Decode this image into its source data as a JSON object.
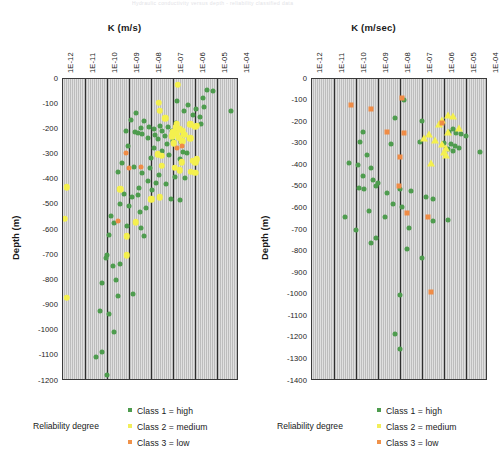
{
  "scan_header": "Hydraulic conductivity versus depth - reliability classified data",
  "legend": {
    "title": "Reliability degree",
    "items": [
      {
        "label": "Class 1 = high",
        "color": "#4e9c4e",
        "shape": "square"
      },
      {
        "label": "Class 2 = medium",
        "color": "#f2ee5a",
        "shape": "square"
      },
      {
        "label": "Class 3 = low",
        "color": "#f0924a",
        "shape": "square"
      }
    ]
  },
  "colors": {
    "class1": "#4e9c4e",
    "class2": "#f4f04e",
    "class3": "#f08c46",
    "plot_background": "#c9c9c9",
    "axis": "#2e2e2e"
  },
  "chart_data": [
    {
      "id": "left",
      "type": "scatter",
      "title": "",
      "xlabel": "K (m/s)",
      "ylabel": "Depth (m)",
      "xscale": "log",
      "xlim": [
        1e-12,
        0.0001
      ],
      "xticks": [
        1e-12,
        1e-11,
        1e-10,
        1e-09,
        1e-08,
        1e-07,
        1e-06,
        1e-05,
        0.0001
      ],
      "xticklabels": [
        "1E-12",
        "1E-11",
        "1E-10",
        "1E-09",
        "1E-08",
        "1E-07",
        "1E-06",
        "1E-05",
        "1E-04"
      ],
      "ylim": [
        -1200,
        0
      ],
      "yticks": [
        0,
        -100,
        -200,
        -300,
        -400,
        -500,
        -600,
        -700,
        -800,
        -900,
        -1000,
        -1100,
        -1200
      ],
      "yticklabels": [
        "0",
        "-100",
        "-200",
        "-300",
        "-400",
        "-500",
        "-600",
        "-700",
        "-800",
        "-900",
        "-1000",
        "-1100",
        "-1200"
      ],
      "grid": "vertical",
      "legend_position": "below",
      "series": [
        {
          "name": "Class 1 = high",
          "marker": "circle",
          "color": "#4e9c4e",
          "points": [
            [
              3.5e-06,
              -45
            ],
            [
              6.5e-06,
              -48
            ],
            [
              2.2e-06,
              -75
            ],
            [
              1.5e-07,
              -88
            ],
            [
              5e-07,
              -105
            ],
            [
              2.5e-06,
              -110
            ],
            [
              1.1e-06,
              -118
            ],
            [
              4.5e-05,
              -125
            ],
            [
              3e-07,
              -128
            ],
            [
              2e-09,
              -133
            ],
            [
              8e-07,
              -142
            ],
            [
              1.6e-06,
              -150
            ],
            [
              1.2e-09,
              -163
            ],
            [
              5e-09,
              -168
            ],
            [
              1.3e-07,
              -175
            ],
            [
              1.9e-06,
              -178
            ],
            [
              3.5e-09,
              -195
            ],
            [
              7e-10,
              -206
            ],
            [
              1.8e-09,
              -212
            ],
            [
              2.6e-09,
              -215
            ],
            [
              4e-09,
              -218
            ],
            [
              2.5e-08,
              -186
            ],
            [
              8e-09,
              -190
            ],
            [
              6e-08,
              -192
            ],
            [
              1.3e-08,
              -200
            ],
            [
              3e-08,
              -205
            ],
            [
              9e-08,
              -208
            ],
            [
              1.5e-08,
              -222
            ],
            [
              4.5e-08,
              -228
            ],
            [
              7.5e-09,
              -236
            ],
            [
              2e-08,
              -240
            ],
            [
              1e-07,
              -247
            ],
            [
              2.4e-07,
              -252
            ],
            [
              5.5e-08,
              -258
            ],
            [
              9e-10,
              -268
            ],
            [
              1.4e-08,
              -272
            ],
            [
              3.2e-08,
              -285
            ],
            [
              2.8e-07,
              -288
            ],
            [
              4.2e-07,
              -292
            ],
            [
              6.5e-08,
              -300
            ],
            [
              1e-08,
              -312
            ],
            [
              2e-07,
              -318
            ],
            [
              5e-10,
              -335
            ],
            [
              1.6e-09,
              -348
            ],
            [
              9e-09,
              -352
            ],
            [
              3e-10,
              -368
            ],
            [
              4e-09,
              -375
            ],
            [
              2.2e-08,
              -382
            ],
            [
              1.2e-07,
              -388
            ],
            [
              3.6e-07,
              -395
            ],
            [
              7e-09,
              -405
            ],
            [
              1.7e-08,
              -412
            ],
            [
              5e-08,
              -418
            ],
            [
              2.8e-09,
              -432
            ],
            [
              1.1e-08,
              -440
            ],
            [
              6e-10,
              -455
            ],
            [
              2.5e-09,
              -462
            ],
            [
              1.4e-09,
              -470
            ],
            [
              8e-08,
              -478
            ],
            [
              2e-07,
              -482
            ],
            [
              4e-10,
              -498
            ],
            [
              1e-09,
              -505
            ],
            [
              6e-09,
              -512
            ],
            [
              3e-09,
              -528
            ],
            [
              1.5e-10,
              -545
            ],
            [
              2e-10,
              -572
            ],
            [
              8e-10,
              -585
            ],
            [
              3.5e-09,
              -592
            ],
            [
              1.2e-10,
              -618
            ],
            [
              5e-09,
              -625
            ],
            [
              1e-10,
              -700
            ],
            [
              9e-11,
              -712
            ],
            [
              4e-10,
              -735
            ],
            [
              1.8e-10,
              -742
            ],
            [
              2.5e-10,
              -800
            ],
            [
              6e-11,
              -812
            ],
            [
              1.5e-09,
              -855
            ],
            [
              3e-10,
              -862
            ],
            [
              5e-11,
              -920
            ],
            [
              1.2e-10,
              -935
            ],
            [
              2e-10,
              -1005
            ],
            [
              6e-11,
              -1085
            ],
            [
              3e-11,
              -1105
            ],
            [
              1e-10,
              -1175
            ]
          ]
        },
        {
          "name": "Class 2 = medium",
          "marker": "circle",
          "color": "#f4f04e",
          "points": [
            [
              1.6e-07,
              -22
            ],
            [
              2.2e-08,
              -95
            ],
            [
              2.5e-08,
              -125
            ],
            [
              4.5e-08,
              -155
            ],
            [
              1.5e-07,
              -178
            ],
            [
              6e-07,
              -180
            ],
            [
              1.4e-07,
              -192
            ],
            [
              2e-07,
              -200
            ],
            [
              2.8e-07,
              -205
            ],
            [
              1e-07,
              -212
            ],
            [
              1.5e-07,
              -218
            ],
            [
              3.2e-07,
              -222
            ],
            [
              9e-08,
              -228
            ],
            [
              1.8e-07,
              -233
            ],
            [
              6e-07,
              -235
            ],
            [
              2.6e-07,
              -248
            ],
            [
              1.1e-07,
              -255
            ],
            [
              2e-08,
              -298
            ],
            [
              3e-08,
              -305
            ],
            [
              1.2e-06,
              -185
            ],
            [
              1e-06,
              -190
            ],
            [
              2.5e-07,
              -330
            ],
            [
              8e-07,
              -325
            ],
            [
              1.2e-06,
              -318
            ],
            [
              1e-06,
              -330
            ],
            [
              3e-08,
              -345
            ],
            [
              1.2e-07,
              -352
            ],
            [
              2e-07,
              -362
            ],
            [
              6.5e-07,
              -368
            ],
            [
              1e-06,
              -372
            ],
            [
              1.5e-12,
              -430
            ],
            [
              4e-10,
              -438
            ],
            [
              2.5e-08,
              -470
            ],
            [
              1e-08,
              -478
            ],
            [
              1.2e-12,
              -555
            ],
            [
              2e-09,
              -570
            ],
            [
              8e-10,
              -625
            ],
            [
              8e-10,
              -700
            ],
            [
              1.5e-12,
              -870
            ]
          ]
        },
        {
          "name": "Class 3 = low",
          "marker": "circle",
          "color": "#f08c46",
          "points": [
            [
              1.5e-07,
              -272
            ],
            [
              7e-10,
              -292
            ],
            [
              3.5e-09,
              -348
            ],
            [
              2.5e-07,
              -265
            ],
            [
              3e-10,
              -565
            ],
            [
              1e-09,
              -352
            ]
          ]
        }
      ]
    },
    {
      "id": "right",
      "type": "scatter",
      "title": "",
      "xlabel": "K (m/sec)",
      "ylabel": "Depth (m)",
      "xscale": "log",
      "xlim": [
        1e-12,
        0.0001
      ],
      "xticks": [
        1e-12,
        1e-11,
        1e-10,
        1e-09,
        1e-08,
        1e-07,
        1e-06,
        1e-05,
        0.0001
      ],
      "xticklabels": [
        "1E-12",
        "1E-11",
        "1E-10",
        "1E-09",
        "1E-08",
        "1E-07",
        "1E-06",
        "1E-05",
        "1E-04"
      ],
      "ylim": [
        -1400,
        0
      ],
      "yticks": [
        0,
        -100,
        -200,
        -300,
        -400,
        -500,
        -600,
        -700,
        -800,
        -900,
        -1000,
        -1100,
        -1200,
        -1300,
        -1400
      ],
      "yticklabels": [
        "0",
        "-100",
        "-200",
        "-300",
        "-400",
        "-500",
        "-600",
        "-700",
        "-800",
        "-900",
        "-1000",
        "-1100",
        "-1200",
        "-1300",
        "-1400"
      ],
      "grid": "vertical",
      "legend_position": "below",
      "series": [
        {
          "name": "Class 1 = high",
          "marker": "circle",
          "color": "#4e9c4e",
          "points": [
            [
              1.5e-08,
              -95
            ],
            [
              6e-09,
              -180
            ],
            [
              1e-07,
              -195
            ],
            [
              2.5e-06,
              -232
            ],
            [
              1.6e-06,
              -245
            ],
            [
              3.5e-06,
              -248
            ],
            [
              6e-06,
              -255
            ],
            [
              1e-05,
              -265
            ],
            [
              4e-09,
              -300
            ],
            [
              8e-08,
              -292
            ],
            [
              2e-06,
              -300
            ],
            [
              3e-06,
              -310
            ],
            [
              5e-06,
              -318
            ],
            [
              1.5e-06,
              -325
            ],
            [
              2.5e-06,
              -332
            ],
            [
              2e-10,
              -245
            ],
            [
              4.5e-05,
              -338
            ],
            [
              1.5e-10,
              -290
            ],
            [
              3e-10,
              -352
            ],
            [
              1.2e-10,
              -400
            ],
            [
              5e-10,
              -412
            ],
            [
              2e-10,
              -450
            ],
            [
              6e-10,
              -468
            ],
            [
              1e-09,
              -480
            ],
            [
              8e-10,
              -495
            ],
            [
              1.4e-10,
              -505
            ],
            [
              2.2e-10,
              -512
            ],
            [
              1e-08,
              -512
            ],
            [
              3e-08,
              -520
            ],
            [
              2.5e-09,
              -528
            ],
            [
              1.5e-07,
              -545
            ],
            [
              3e-07,
              -555
            ],
            [
              1e-06,
              -295
            ],
            [
              5e-09,
              -580
            ],
            [
              1.2e-08,
              -595
            ],
            [
              4e-10,
              -612
            ],
            [
              2e-09,
              -640
            ],
            [
              1e-10,
              -700
            ],
            [
              2.5e-08,
              -690
            ],
            [
              3e-07,
              -660
            ],
            [
              1.5e-06,
              -655
            ],
            [
              8e-10,
              -735
            ],
            [
              5e-10,
              -760
            ],
            [
              2e-08,
              -790
            ],
            [
              1e-07,
              -830
            ],
            [
              1e-08,
              -1000
            ],
            [
              6e-09,
              -1180
            ],
            [
              1e-08,
              -1250
            ],
            [
              3e-11,
              -640
            ],
            [
              5e-11,
              -390
            ]
          ]
        },
        {
          "name": "Class 2 = medium",
          "marker": "triangle",
          "color": "#f4f04e",
          "points": [
            [
              8e-07,
              -188
            ],
            [
              6e-07,
              -210
            ],
            [
              1.5e-06,
              -165
            ],
            [
              2.5e-06,
              -172
            ],
            [
              5e-06,
              -228
            ],
            [
              2e-07,
              -255
            ],
            [
              1.2e-07,
              -275
            ],
            [
              4e-07,
              -283
            ],
            [
              8e-07,
              -300
            ],
            [
              1.2e-06,
              -320
            ],
            [
              1e-06,
              -340
            ],
            [
              1.2e-06,
              -352
            ],
            [
              2.5e-07,
              -390
            ],
            [
              1.5e-06,
              -245
            ]
          ]
        },
        {
          "name": "Class 3 = low",
          "marker": "square",
          "color": "#f08c46",
          "points": [
            [
              1.2e-08,
              -88
            ],
            [
              5e-10,
              -140
            ],
            [
              6e-11,
              -118
            ],
            [
              2.5e-09,
              -245
            ],
            [
              1.5e-08,
              -250
            ],
            [
              8e-07,
              -205
            ],
            [
              1e-08,
              -360
            ],
            [
              9e-09,
              -498
            ],
            [
              2e-08,
              -620
            ],
            [
              1.8e-07,
              -640
            ],
            [
              2.5e-07,
              -985
            ]
          ]
        }
      ]
    }
  ]
}
